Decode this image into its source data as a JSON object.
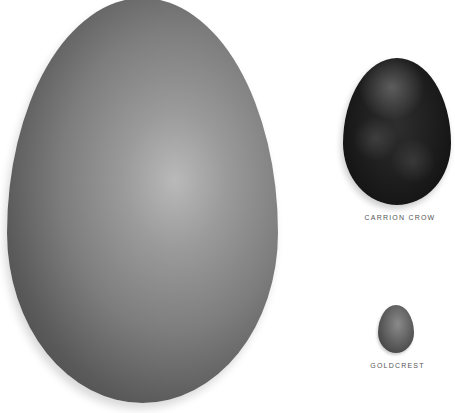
{
  "image": {
    "description": "Photograph comparing bird egg sizes on white background",
    "eggs": [
      {
        "id": "large",
        "label": null
      },
      {
        "id": "crow",
        "label": "CARRION CROW"
      },
      {
        "id": "goldcrest",
        "label": "GOLDCREST"
      }
    ]
  },
  "labels": {
    "crow": "CARRION CROW",
    "goldcrest": "GOLDCREST"
  },
  "colors": {
    "background": "#ffffff",
    "large_egg": "#8a8a8a",
    "crow_egg": "#1a1a1a",
    "goldcrest_egg": "#6a6a6a",
    "label_text": "#555555"
  }
}
